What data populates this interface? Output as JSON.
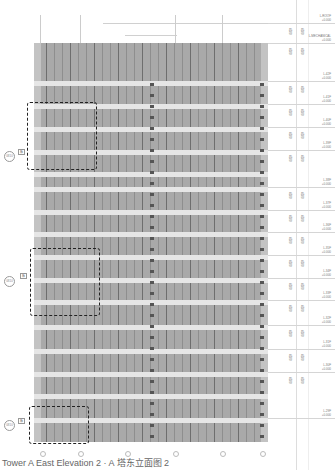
{
  "caption": "Tower A East Elevation 2 · A 塔东立面图 2",
  "facade": {
    "fill_color": "#a9a9a9",
    "band_color": "#e6e6e6",
    "band_positions_y": [
      81,
      104,
      127,
      150,
      172,
      187,
      210,
      232,
      255,
      278,
      300,
      325,
      349,
      372,
      394,
      418
    ],
    "grid_x": [
      42,
      80,
      127,
      175,
      222,
      262
    ]
  },
  "callouts": [
    {
      "id": "callout-1",
      "circle_label": "0810",
      "tag": "板"
    },
    {
      "id": "callout-2",
      "circle_label": "0810",
      "tag": "板"
    },
    {
      "id": "callout-3",
      "circle_label": "0810",
      "tag": "板"
    }
  ],
  "levels": [
    {
      "name": "L-ROOF",
      "elev": "+0.000"
    },
    {
      "name": "L-MECHANICAL",
      "elev": "+0.000"
    },
    {
      "name": "L-42F",
      "elev": "+0.000"
    },
    {
      "name": "L-41F",
      "elev": "+0.000"
    },
    {
      "name": "L-40F",
      "elev": "+0.000"
    },
    {
      "name": "L-39F",
      "elev": "+0.000"
    },
    {
      "name": "L-38F",
      "elev": "+0.000"
    },
    {
      "name": "L-37F",
      "elev": "+0.000"
    },
    {
      "name": "L-36F",
      "elev": "+0.000"
    },
    {
      "name": "L-35F",
      "elev": "+0.000"
    },
    {
      "name": "L-34F",
      "elev": "+0.000"
    },
    {
      "name": "L-33F",
      "elev": "+0.000"
    },
    {
      "name": "L-32F",
      "elev": "+0.000"
    },
    {
      "name": "L-31F",
      "elev": "+0.000"
    },
    {
      "name": "L-30F",
      "elev": "+0.000"
    },
    {
      "name": "L-29F",
      "elev": "+0.000"
    }
  ],
  "dimensions": [
    "4500",
    "4500",
    "4500",
    "4500",
    "4500",
    "4500",
    "4500",
    "4500",
    "4500",
    "4500",
    "4500",
    "4500",
    "4500",
    "4500",
    "4500",
    "4500"
  ]
}
